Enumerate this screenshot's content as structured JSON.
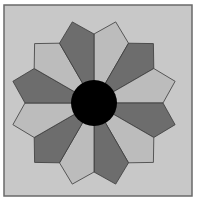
{
  "diagram": {
    "type": "dresden-plate-quilt-block",
    "frame": {
      "x": 4,
      "y": 5,
      "width": 188,
      "height": 191,
      "fill": "#c8c8c8",
      "stroke": "#6a6a6a"
    },
    "center": {
      "cx": 94,
      "cy": 103,
      "r": 23,
      "fill": "#000000"
    },
    "blade_count": 12,
    "colors": {
      "light": "#bcbcbc",
      "dark": "#6d6d6d",
      "outline": "#3a3a3a"
    },
    "blades": [
      {
        "points": "94,103 94,34 115.7,21.9 128.5,43.2",
        "tone": "light"
      },
      {
        "points": "94,103 128.5,43.2 153.4,43.6 153.8,68.5",
        "tone": "dark"
      },
      {
        "points": "94,103 153.8,68.5 175.1,81.3 163,103",
        "tone": "light"
      },
      {
        "points": "94,103 163,103 175.1,124.7 153.8,137.5",
        "tone": "dark"
      },
      {
        "points": "94,103 153.8,137.5 153.4,162.4 128.5,162.8",
        "tone": "light"
      },
      {
        "points": "94,103 128.5,162.8 115.7,184.1 94,172",
        "tone": "dark"
      },
      {
        "points": "94,103 94,172 72.3,184.1 59.5,162.8",
        "tone": "light"
      },
      {
        "points": "94,103 59.5,162.8 34.6,162.4 34.2,137.5",
        "tone": "dark"
      },
      {
        "points": "94,103 34.2,137.5 12.9,124.7 25,103",
        "tone": "light"
      },
      {
        "points": "94,103 25,103 12.9,81.3 34.2,68.5",
        "tone": "dark"
      },
      {
        "points": "94,103 34.2,68.5 34.6,43.6 59.5,43.2",
        "tone": "light"
      },
      {
        "points": "94,103 59.5,43.2 72.3,21.9 94,34",
        "tone": "dark"
      }
    ]
  }
}
